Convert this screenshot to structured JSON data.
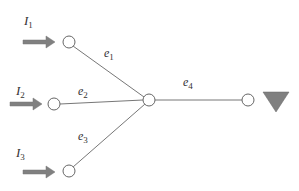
{
  "diagram": {
    "colors": {
      "edge": "#777777",
      "node_stroke": "#666666",
      "arrow_fill": "#808080",
      "sink_fill": "#808080"
    },
    "inputs": [
      {
        "label": "I",
        "sub": "1"
      },
      {
        "label": "I",
        "sub": "2"
      },
      {
        "label": "I",
        "sub": "3"
      }
    ],
    "edges": [
      {
        "label": "e",
        "sub": "1"
      },
      {
        "label": "e",
        "sub": "2"
      },
      {
        "label": "e",
        "sub": "3"
      },
      {
        "label": "e",
        "sub": "4"
      }
    ],
    "sink": {
      "icon": "downward-triangle-sink-icon"
    }
  }
}
